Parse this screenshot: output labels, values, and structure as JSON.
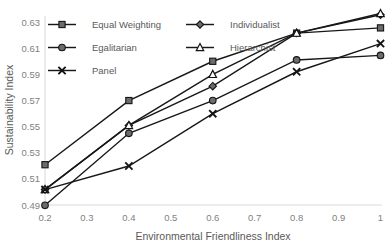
{
  "chart_data": {
    "type": "line",
    "title": "",
    "xlabel": "Environmental Friendliness Index",
    "ylabel": "Sustainability Index",
    "xlim": [
      0.2,
      1.0
    ],
    "ylim": [
      0.49,
      0.63
    ],
    "xticks": [
      "0.2",
      "0.3",
      "0.4",
      "0.5",
      "0.6",
      "0.7",
      "0.8",
      "0.9",
      "1"
    ],
    "yticks": [
      "0.49",
      "0.51",
      "0.53",
      "0.55",
      "0.57",
      "0.59",
      "0.61",
      "0.63"
    ],
    "grid": false,
    "legend_position": "top-left-inside",
    "x": [
      0.2,
      0.4,
      0.6,
      0.8,
      1.0
    ],
    "series": [
      {
        "name": "Equal Weighting",
        "marker": "square",
        "values": [
          0.521,
          0.57,
          0.6,
          0.6215,
          0.6255
        ]
      },
      {
        "name": "Individualist",
        "marker": "diamond",
        "values": [
          0.502,
          0.551,
          0.581,
          0.6215,
          0.6355
        ]
      },
      {
        "name": "Egalitarian",
        "marker": "circle",
        "values": [
          0.49,
          0.545,
          0.57,
          0.601,
          0.6045
        ]
      },
      {
        "name": "Hierarchist",
        "marker": "triangle",
        "values": [
          0.502,
          0.551,
          0.59,
          0.6215,
          0.6365
        ]
      },
      {
        "name": "Panel",
        "marker": "cross",
        "values": [
          0.502,
          0.52,
          0.56,
          0.592,
          0.6135
        ]
      }
    ]
  },
  "legend": {
    "items": [
      {
        "label": "Equal Weighting",
        "marker": "square"
      },
      {
        "label": "Individualist",
        "marker": "diamond"
      },
      {
        "label": "Egalitarian",
        "marker": "circle"
      },
      {
        "label": "Hierarchist",
        "marker": "triangle"
      },
      {
        "label": "Panel",
        "marker": "cross"
      }
    ]
  },
  "colors": {
    "line": "#181818",
    "marker_fill": "#6b6b6b",
    "axis": "#d9d9d9",
    "text": "#595959",
    "tick_text": "#7f7f7f"
  }
}
